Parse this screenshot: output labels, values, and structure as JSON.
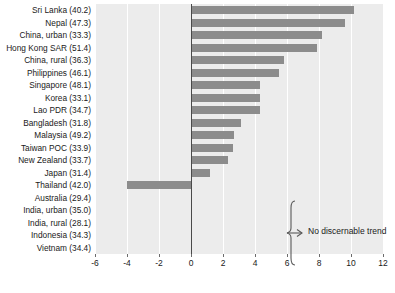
{
  "chart_data": {
    "type": "bar",
    "orientation": "horizontal",
    "title": "",
    "subtitle": "",
    "xlabel": "",
    "ylabel": "",
    "xlim": [
      -6,
      12
    ],
    "ylim": null,
    "grid": true,
    "grid_orientation": "vertical",
    "legend": null,
    "xticks": [
      -6,
      -4,
      -2,
      0,
      2,
      4,
      6,
      8,
      10,
      12
    ],
    "xtick_labels": [
      "-6",
      "-4",
      "-2",
      "0",
      "2",
      "4",
      "6",
      "8",
      "10",
      "12"
    ],
    "categories": [
      "Sri Lanka (40.2)",
      "Nepal (47.3)",
      "China, urban (33.3)",
      "Hong Kong SAR (51.4)",
      "China, rural (36.3)",
      "Philippines (46.1)",
      "Singapore (48.1)",
      "Korea (33.1)",
      "Lao PDR (34.7)",
      "Bangladesh (31.8)",
      "Malaysia (49.2)",
      "Taiwan POC (33.9)",
      "New Zealand (33.7)",
      "Japan (31.4)",
      "Thailand (42.0)",
      "Australia (29.4)",
      "India, urban (35.0)",
      "India, rural (28.1)",
      "Indonesia (34.3)",
      "Vietnam (34.4)"
    ],
    "values": [
      10.2,
      9.6,
      8.2,
      7.9,
      5.8,
      5.5,
      4.3,
      4.3,
      4.3,
      3.1,
      2.7,
      2.6,
      2.3,
      1.2,
      -4.0,
      null,
      null,
      null,
      null,
      null
    ],
    "bar_color": "#8c8c8c",
    "plot_background": "#ececec",
    "gridline_color": "#ffffff",
    "zero_line_color": "#4a4a4a",
    "annotations": [
      {
        "text": "No discernable trend",
        "covers_categories": [
          "Australia (29.4)",
          "India, urban (35.0)",
          "India, rural (28.1)",
          "Indonesia (34.3)",
          "Vietnam (34.4)"
        ]
      }
    ]
  }
}
